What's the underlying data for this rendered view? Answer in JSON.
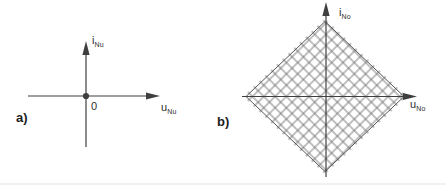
{
  "colors": {
    "ink": "#3f3f3f",
    "outline": "#565656",
    "grid": "#6a6a6a",
    "background": "#ffffff",
    "scan_artifact": "#ececec"
  },
  "panel_a": {
    "tag": "a)",
    "y_axis_label": {
      "base": "i",
      "sub": "Nu"
    },
    "x_axis_label": {
      "base": "u",
      "sub": "Nu"
    },
    "origin_label": "0"
  },
  "panel_b": {
    "tag": "b)",
    "y_axis_label": {
      "base": "i",
      "sub": "No"
    },
    "x_axis_label": {
      "base": "u",
      "sub": "No"
    },
    "grid": {
      "pattern": "crosshatch-45deg",
      "cells_per_side": 14
    }
  }
}
